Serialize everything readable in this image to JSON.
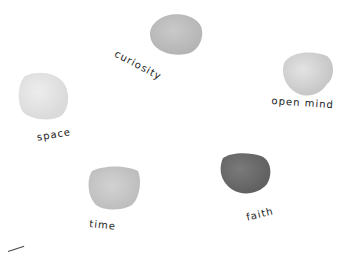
{
  "illustration": {
    "stones": [
      {
        "id": "curiosity",
        "label": "curiosity",
        "shade": "#c9c9c9",
        "edge": "#b4b4b4"
      },
      {
        "id": "open-mind",
        "label": "open mind",
        "shade": "#e3e3e3",
        "edge": "#c6c6c6"
      },
      {
        "id": "space",
        "label": "space",
        "shade": "#ededed",
        "edge": "#dadada"
      },
      {
        "id": "time",
        "label": "time",
        "shade": "#d2d2d2",
        "edge": "#bcbcbc"
      },
      {
        "id": "faith",
        "label": "faith",
        "shade": "#7a7a7a",
        "edge": "#5e5e5e"
      }
    ]
  }
}
